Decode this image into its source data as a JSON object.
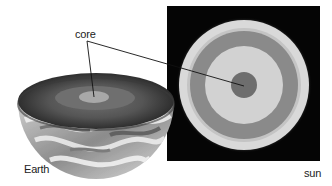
{
  "diagram": {
    "labels": {
      "core": "core",
      "earth": "Earth",
      "sun": "sun"
    },
    "earth": {
      "description": "Earth hemisphere cut open showing layered interior with core",
      "colors": {
        "crust_surface": "#9a9a9a",
        "mantle_outer": "#4a4a4a",
        "mantle_inner": "#6a6a6a",
        "outer_core": "#7c7c7c",
        "inner_core": "#a8a8a8",
        "clouds": "#e6e6e6"
      }
    },
    "sun": {
      "description": "Sun cross-section on black background showing concentric layers",
      "background": "#050505",
      "colors": {
        "halo": "#d9d9d9",
        "outer_light": "#c8c8c8",
        "thin_band": "#a0a0a0",
        "gray_band": "#8a8a8a",
        "light_band": "#d2d2d2",
        "core": "#6e6e6e"
      }
    }
  }
}
